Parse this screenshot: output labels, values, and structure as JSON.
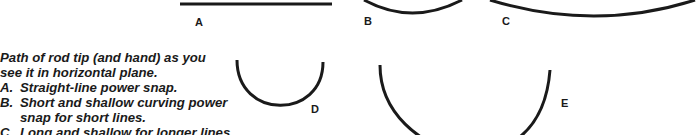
{
  "diagram": {
    "caption": {
      "intro_line1": "Path of rod tip (and hand) as you",
      "intro_line2": "see it in horizontal plane.",
      "items": [
        {
          "key": "A.",
          "lines": [
            "Straight-line power snap."
          ]
        },
        {
          "key": "B.",
          "lines": [
            "Short and shallow curving power",
            "snap for short lines."
          ]
        },
        {
          "key": "C.",
          "lines": [
            "Long and shallow for longer lines"
          ]
        }
      ]
    },
    "paths": [
      {
        "id": "A",
        "label": "A",
        "shape": "straight line"
      },
      {
        "id": "B",
        "label": "B",
        "shape": "short shallow arc"
      },
      {
        "id": "C",
        "label": "C",
        "shape": "long shallow arc"
      },
      {
        "id": "D",
        "label": "D",
        "shape": "small deep semicircle"
      },
      {
        "id": "E",
        "label": "E",
        "shape": "large deep arc"
      }
    ],
    "stroke_color": "#1a1a1a",
    "background": "#ffffff"
  }
}
